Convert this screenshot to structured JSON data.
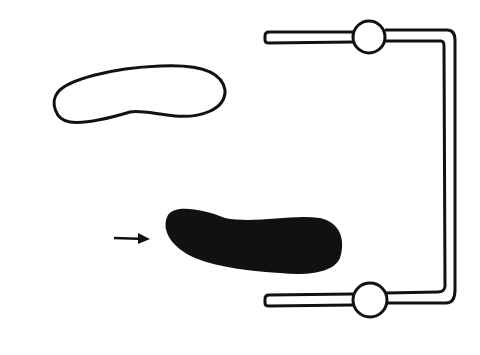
{
  "diagram": {
    "description": "Line drawing: outlined blob, filled black blob with arrow, and bracket-shaped tube with two circular valves",
    "colors": {
      "ink": "#111111",
      "background": "#ffffff"
    },
    "elements": [
      {
        "name": "outlined-blob",
        "fill": "none"
      },
      {
        "name": "filled-blob",
        "fill": "#111111"
      },
      {
        "name": "arrow",
        "direction": "right"
      },
      {
        "name": "bracket-tube",
        "shape": "U-bracket open left"
      },
      {
        "name": "valve-top"
      },
      {
        "name": "valve-bottom"
      }
    ]
  }
}
